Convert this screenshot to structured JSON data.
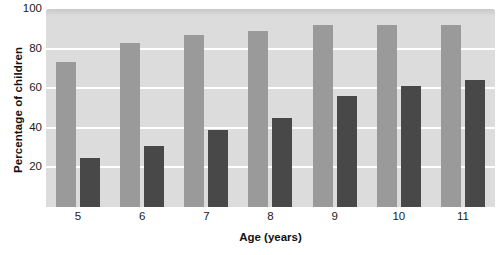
{
  "chart_data": {
    "type": "bar",
    "title": "",
    "xlabel": "Age (years)",
    "ylabel": "Percentage of children",
    "categories": [
      "5",
      "6",
      "7",
      "8",
      "9",
      "10",
      "11"
    ],
    "series": [
      {
        "name": "series-light",
        "color": "#9a9a9a",
        "values": [
          73,
          83,
          87,
          89,
          92,
          92,
          92
        ]
      },
      {
        "name": "series-dark",
        "color": "#484848",
        "values": [
          25,
          31,
          39,
          45,
          56,
          61,
          64
        ]
      }
    ],
    "ylim": [
      0,
      100
    ],
    "yticks": [
      "20",
      "40",
      "60",
      "80",
      "100"
    ],
    "ytick_values": [
      20,
      40,
      60,
      80,
      100
    ],
    "grid": true,
    "legend": "none",
    "plot_background": "#dcdcdc",
    "gridline_color": "#ffffff"
  }
}
